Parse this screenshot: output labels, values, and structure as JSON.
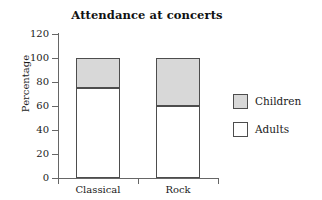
{
  "chart_data": {
    "type": "bar",
    "subtype": "stacked-bar",
    "title": "Attendance at concerts",
    "xlabel": "",
    "ylabel": "Percentage",
    "categories": [
      "Classical",
      "Rock"
    ],
    "series": [
      {
        "name": "Adults",
        "values": [
          75,
          60
        ],
        "color": "#ffffff"
      },
      {
        "name": "Children",
        "values": [
          25,
          40
        ],
        "color": "#d8d8d8"
      }
    ],
    "stack_order_bottom_to_top": [
      "Adults",
      "Children"
    ],
    "ylim": [
      0,
      120
    ],
    "yticks": [
      0,
      20,
      40,
      60,
      80,
      100,
      120
    ],
    "ytick_labels": [
      "0",
      "20",
      "40",
      "60",
      "80",
      "100",
      "120"
    ],
    "grid": false,
    "legend": {
      "position": "right",
      "entries": [
        {
          "label": "Children",
          "color": "#d8d8d8"
        },
        {
          "label": "Adults",
          "color": "#ffffff"
        }
      ]
    },
    "bar_totals": [
      100,
      100
    ],
    "segment_boundaries": {
      "Classical": 75,
      "Rock": 60
    }
  },
  "colors": {
    "children_fill": "#d8d8d8",
    "adults_fill": "#ffffff",
    "bar_stroke": "#4d4d4d",
    "axis": "#666666",
    "text": "#1a1a1a"
  }
}
